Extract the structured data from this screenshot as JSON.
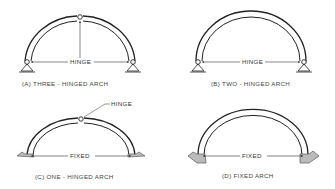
{
  "figure": {
    "panels": [
      {
        "id": "A",
        "caption": "(A) THREE - HINGED  ARCH",
        "dimension_label": "HINGE",
        "supports": "pinned",
        "crown_hinge": true
      },
      {
        "id": "B",
        "caption": "(B)  TWO - HINGED  ARCH",
        "dimension_label": "HINGE",
        "supports": "pinned",
        "crown_hinge": false
      },
      {
        "id": "C",
        "caption": "(C) ONE - HINGED  ARCH",
        "dimension_label": "FIXED",
        "callout_label": "HINGE",
        "supports": "fixed",
        "crown_hinge": true
      },
      {
        "id": "D",
        "caption": "(D) FIXED  ARCH",
        "dimension_label": "FIXED",
        "supports": "fixed",
        "crown_hinge": false
      }
    ]
  }
}
